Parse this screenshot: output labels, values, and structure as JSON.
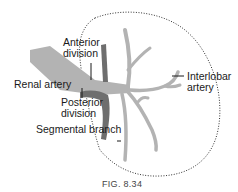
{
  "figure": {
    "caption": "FIG. 8.34",
    "labels": {
      "anterior_division_line1": "Anterior",
      "anterior_division_line2": "division",
      "renal_artery": "Renal artery",
      "posterior_division_line1": "Posterior",
      "posterior_division_line2": "division",
      "segmental_branch": "Segmental branch",
      "interlobar_artery_line1": "Interlobar",
      "interlobar_artery_line2": "artery"
    },
    "colors": {
      "main_vessel": "#b3b3b3",
      "posterior_vessel": "#6e6e6e",
      "leader_lines": "#1a1a1a",
      "kidney_outline": "#333333"
    }
  }
}
